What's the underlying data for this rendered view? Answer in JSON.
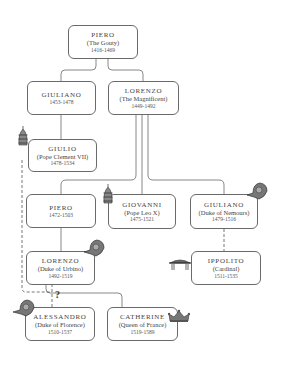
{
  "diagram": {
    "type": "family-tree",
    "nodes": [
      {
        "id": "piero_gouty",
        "name": "PIERO",
        "title": "(The Gouty)",
        "dates": "1416-1469"
      },
      {
        "id": "giuliano_1453",
        "name": "GIULIANO",
        "title": "",
        "dates": "1453-1478"
      },
      {
        "id": "lorenzo_magnificent",
        "name": "LORENZO",
        "title": "(The Magnificent)",
        "dates": "1449-1492"
      },
      {
        "id": "giulio",
        "name": "GIULIO",
        "title": "(Pope Clement VII)",
        "dates": "1478-1534",
        "icon": "papal-tiara-icon"
      },
      {
        "id": "piero_1472",
        "name": "PIERO",
        "title": "",
        "dates": "1472-1503"
      },
      {
        "id": "giovanni",
        "name": "GIOVANNI",
        "title": "(Pope Leo X)",
        "dates": "1475-1521",
        "icon": "papal-tiara-icon"
      },
      {
        "id": "giuliano_nemours",
        "name": "GIULIANO",
        "title": "(Duke of Nemours)",
        "dates": "1479-1516",
        "icon": "ducal-helmet-icon"
      },
      {
        "id": "lorenzo_urbino",
        "name": "LORENZO",
        "title": "(Duke of Urbino)",
        "dates": "1492-1519",
        "icon": "ducal-helmet-icon"
      },
      {
        "id": "ippolito",
        "name": "IPPOLITO",
        "title": "(Cardinal)",
        "dates": "1511-1535",
        "icon": "cardinal-hat-icon"
      },
      {
        "id": "alessandro",
        "name": "ALESSANDRO",
        "title": "(Duke of Florence)",
        "dates": "1510-1537",
        "icon": "ducal-helmet-icon"
      },
      {
        "id": "catherine",
        "name": "CATHERINE",
        "title": "(Queen of France)",
        "dates": "1519-1589",
        "icon": "crown-icon"
      }
    ],
    "edges": [
      {
        "from": "piero_gouty",
        "to": "giuliano_1453",
        "style": "solid"
      },
      {
        "from": "piero_gouty",
        "to": "lorenzo_magnificent",
        "style": "solid"
      },
      {
        "from": "giuliano_1453",
        "to": "giulio",
        "style": "solid"
      },
      {
        "from": "lorenzo_magnificent",
        "to": "piero_1472",
        "style": "solid"
      },
      {
        "from": "lorenzo_magnificent",
        "to": "giovanni",
        "style": "solid"
      },
      {
        "from": "lorenzo_magnificent",
        "to": "giuliano_nemours",
        "style": "solid"
      },
      {
        "from": "piero_1472",
        "to": "lorenzo_urbino",
        "style": "solid"
      },
      {
        "from": "giuliano_nemours",
        "to": "ippolito",
        "style": "dashed"
      },
      {
        "from": "lorenzo_urbino",
        "to": "catherine",
        "style": "solid"
      },
      {
        "from": "lorenzo_urbino",
        "to": "alessandro",
        "style": "dashed",
        "label": "?"
      },
      {
        "from": "giulio",
        "to": "alessandro",
        "style": "dashed"
      }
    ],
    "uncertain_marker": "?"
  }
}
